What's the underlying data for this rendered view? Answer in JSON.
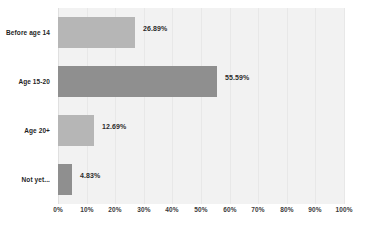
{
  "chart_data": {
    "type": "bar",
    "orientation": "horizontal",
    "title": "",
    "subtitle": "",
    "xlabel": "",
    "ylabel": "",
    "categories": [
      "Before age 14",
      "Age 15-20",
      "Age 20+",
      "Not yet..."
    ],
    "values": [
      26.89,
      55.59,
      12.69,
      4.83
    ],
    "value_labels": [
      "26.89%",
      "55.59%",
      "12.69%",
      "4.83%"
    ],
    "bar_tones": [
      "light",
      "dark",
      "light",
      "dark"
    ],
    "xlim": [
      0,
      100
    ],
    "xticks": [
      0,
      10,
      20,
      30,
      40,
      50,
      60,
      70,
      80,
      90,
      100
    ],
    "xtick_labels": [
      "0%",
      "10%",
      "20%",
      "30%",
      "40%",
      "50%",
      "60%",
      "70%",
      "80%",
      "90%",
      "100%"
    ],
    "grid": true,
    "legend": false,
    "colors": {
      "bar_light": "#b6b6b6",
      "bar_dark": "#8f8f8f",
      "plot_background": "#f2f2f2",
      "page_background": "#ffffff",
      "gridline": "#e8e8e8",
      "label_text": "#1f1f1f",
      "value_text": "#2b2b2b",
      "tick_text": "#3a3a3a"
    }
  }
}
